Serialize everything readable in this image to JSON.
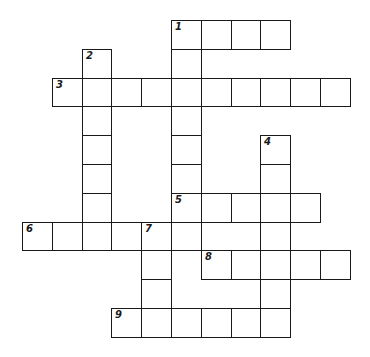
{
  "puzzle": {
    "type": "crossword",
    "ink_color": "#1a1a1a",
    "paper_color": "#ffffff",
    "grid_origin": {
      "x": 22,
      "y": 20
    },
    "cell_size": {
      "w": 29.8,
      "h": 28.8
    },
    "entries": [
      {
        "number": "1",
        "direction": "across",
        "row": 0,
        "col": 5,
        "length": 4
      },
      {
        "number": "1",
        "direction": "down",
        "row": 0,
        "col": 5,
        "length": 8
      },
      {
        "number": "2",
        "direction": "down",
        "row": 1,
        "col": 2,
        "length": 7
      },
      {
        "number": "3",
        "direction": "across",
        "row": 2,
        "col": 1,
        "length": 10
      },
      {
        "number": "4",
        "direction": "down",
        "row": 4,
        "col": 8,
        "length": 7
      },
      {
        "number": "5",
        "direction": "across",
        "row": 6,
        "col": 5,
        "length": 5
      },
      {
        "number": "6",
        "direction": "across",
        "row": 7,
        "col": 0,
        "length": 6
      },
      {
        "number": "7",
        "direction": "down",
        "row": 7,
        "col": 4,
        "length": 4
      },
      {
        "number": "8",
        "direction": "across",
        "row": 8,
        "col": 6,
        "length": 5
      },
      {
        "number": "9",
        "direction": "across",
        "row": 10,
        "col": 3,
        "length": 6
      }
    ]
  }
}
